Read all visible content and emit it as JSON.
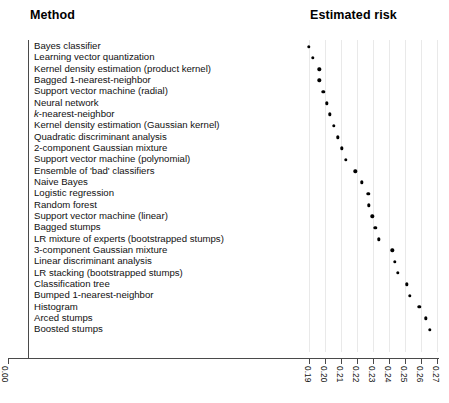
{
  "header": {
    "method_label": "Method",
    "risk_label": "Estimated risk"
  },
  "axis": {
    "origin_label": "0.00",
    "tick_labels": [
      "0.19",
      "0.20",
      "0.21",
      "0.22",
      "0.23",
      "0.24",
      "0.25",
      "0.26",
      "0.27"
    ]
  },
  "chart_data": {
    "type": "scatter",
    "title": "",
    "xlabel": "Estimated risk",
    "ylabel": "Method",
    "xlim": [
      0.19,
      0.27
    ],
    "grid": true,
    "orientation": "horizontal-dotplot",
    "axis_break": true,
    "note": "Dot plot of estimated risk per classification method, sorted ascending; x-axis is broken between 0.00 and 0.19",
    "categories": [
      "Bayes classifier",
      "Learning vector quantization",
      "Kernel density estimation (product kernel)",
      "Bagged 1-nearest-neighbor",
      "Support vector machine (radial)",
      "Neural network",
      "k-nearest-neighbor",
      "Kernel density estimation (Gaussian kernel)",
      "Quadratic discriminant analysis",
      "2-component Gaussian mixture",
      "Support vector machine (polynomial)",
      "Ensemble of 'bad' classifiers",
      "Naive Bayes",
      "Logistic regression",
      "Random forest",
      "Support vector machine (linear)",
      "Bagged stumps",
      "LR mixture of experts (bootstrapped stumps)",
      "3-component Gaussian mixture",
      "Linear discriminant analysis",
      "LR stacking (bootstrapped stumps)",
      "Classification tree",
      "Bumped 1-nearest-neighbor",
      "Histogram",
      "Arced stumps",
      "Boosted stumps"
    ],
    "values": [
      0.19,
      0.1925,
      0.1965,
      0.1965,
      0.199,
      0.201,
      0.203,
      0.2055,
      0.208,
      0.2105,
      0.213,
      0.219,
      0.223,
      0.227,
      0.2275,
      0.2295,
      0.2315,
      0.2335,
      0.242,
      0.2435,
      0.2455,
      0.251,
      0.253,
      0.259,
      0.263,
      0.2655
    ],
    "italic_categories": [
      "k-nearest-neighbor"
    ]
  }
}
